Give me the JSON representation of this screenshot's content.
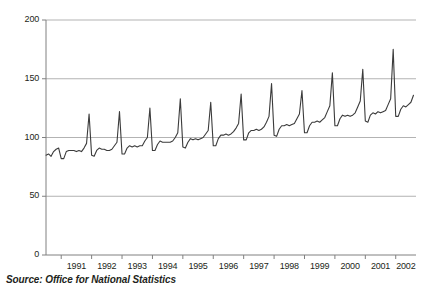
{
  "figure": {
    "source_note": "Source: Office for National Statistics",
    "background_color": "#ffffff",
    "line_color": "#3b3b3b",
    "grid_color": "#b3b3b3",
    "axis_color": "#808080",
    "text_color": "#231f20"
  },
  "chart_data": {
    "type": "line",
    "title": "",
    "subtitle": "",
    "xlabel": "",
    "ylabel": "",
    "ylim": [
      0,
      200
    ],
    "yticks": [
      0,
      50,
      100,
      150,
      200
    ],
    "ytick_labels": [
      "0",
      "50",
      "100",
      "150",
      "200"
    ],
    "grid": "horizontal",
    "legend": "none",
    "xlim": [
      "1990-07",
      "2002-09"
    ],
    "categories": [
      "1991",
      "1992",
      "1993",
      "1994",
      "1995",
      "1996",
      "1997",
      "1998",
      "1999",
      "2000",
      "2001",
      "2002"
    ],
    "xtick_labels": [
      "1991",
      "1992",
      "1993",
      "1994",
      "1995",
      "1996",
      "1997",
      "1998",
      "1999",
      "2000",
      "2001",
      "2002"
    ],
    "series": [
      {
        "name": "Retail sales index",
        "x": [
          "1990-07",
          "1990-08",
          "1990-09",
          "1990-10",
          "1990-11",
          "1990-12",
          "1991-01",
          "1991-02",
          "1991-03",
          "1991-04",
          "1991-05",
          "1991-06",
          "1991-07",
          "1991-08",
          "1991-09",
          "1991-10",
          "1991-11",
          "1991-12",
          "1992-01",
          "1992-02",
          "1992-03",
          "1992-04",
          "1992-05",
          "1992-06",
          "1992-07",
          "1992-08",
          "1992-09",
          "1992-10",
          "1992-11",
          "1992-12",
          "1993-01",
          "1993-02",
          "1993-03",
          "1993-04",
          "1993-05",
          "1993-06",
          "1993-07",
          "1993-08",
          "1993-09",
          "1993-10",
          "1993-11",
          "1993-12",
          "1994-01",
          "1994-02",
          "1994-03",
          "1994-04",
          "1994-05",
          "1994-06",
          "1994-07",
          "1994-08",
          "1994-09",
          "1994-10",
          "1994-11",
          "1994-12",
          "1995-01",
          "1995-02",
          "1995-03",
          "1995-04",
          "1995-05",
          "1995-06",
          "1995-07",
          "1995-08",
          "1995-09",
          "1995-10",
          "1995-11",
          "1995-12",
          "1996-01",
          "1996-02",
          "1996-03",
          "1996-04",
          "1996-05",
          "1996-06",
          "1996-07",
          "1996-08",
          "1996-09",
          "1996-10",
          "1996-11",
          "1996-12",
          "1997-01",
          "1997-02",
          "1997-03",
          "1997-04",
          "1997-05",
          "1997-06",
          "1997-07",
          "1997-08",
          "1997-09",
          "1997-10",
          "1997-11",
          "1997-12",
          "1998-01",
          "1998-02",
          "1998-03",
          "1998-04",
          "1998-05",
          "1998-06",
          "1998-07",
          "1998-08",
          "1998-09",
          "1998-10",
          "1998-11",
          "1998-12",
          "1999-01",
          "1999-02",
          "1999-03",
          "1999-04",
          "1999-05",
          "1999-06",
          "1999-07",
          "1999-08",
          "1999-09",
          "1999-10",
          "1999-11",
          "1999-12",
          "2000-01",
          "2000-02",
          "2000-03",
          "2000-04",
          "2000-05",
          "2000-06",
          "2000-07",
          "2000-08",
          "2000-09",
          "2000-10",
          "2000-11",
          "2000-12",
          "2001-01",
          "2001-02",
          "2001-03",
          "2001-04",
          "2001-05",
          "2001-06",
          "2001-07",
          "2001-08",
          "2001-09",
          "2001-10",
          "2001-11",
          "2001-12",
          "2002-01",
          "2002-02",
          "2002-03",
          "2002-04",
          "2002-05",
          "2002-06",
          "2002-07",
          "2002-08"
        ],
        "values": [
          85,
          86,
          84,
          88,
          90,
          91,
          82,
          82,
          88,
          89,
          89,
          89,
          88,
          89,
          88,
          91,
          95,
          120,
          85,
          84,
          89,
          91,
          90,
          90,
          89,
          89,
          90,
          93,
          96,
          122,
          86,
          86,
          91,
          93,
          92,
          93,
          92,
          93,
          93,
          97,
          100,
          125,
          89,
          89,
          94,
          97,
          96,
          96,
          96,
          96,
          97,
          100,
          104,
          133,
          92,
          91,
          96,
          99,
          98,
          99,
          98,
          99,
          100,
          103,
          106,
          130,
          93,
          93,
          99,
          102,
          102,
          103,
          102,
          103,
          105,
          108,
          112,
          137,
          98,
          98,
          104,
          106,
          106,
          107,
          106,
          107,
          109,
          113,
          118,
          146,
          102,
          101,
          107,
          110,
          110,
          111,
          110,
          111,
          112,
          116,
          120,
          140,
          104,
          104,
          110,
          113,
          113,
          114,
          113,
          115,
          117,
          122,
          127,
          155,
          110,
          110,
          116,
          119,
          118,
          119,
          118,
          119,
          121,
          126,
          131,
          158,
          114,
          113,
          119,
          121,
          120,
          122,
          121,
          122,
          123,
          128,
          133,
          175,
          118,
          118,
          124,
          127,
          126,
          128,
          130,
          136
        ]
      }
    ],
    "annotations": [
      {
        "text": "Source: Office for National Statistics",
        "position": "below-axis-left"
      }
    ]
  }
}
